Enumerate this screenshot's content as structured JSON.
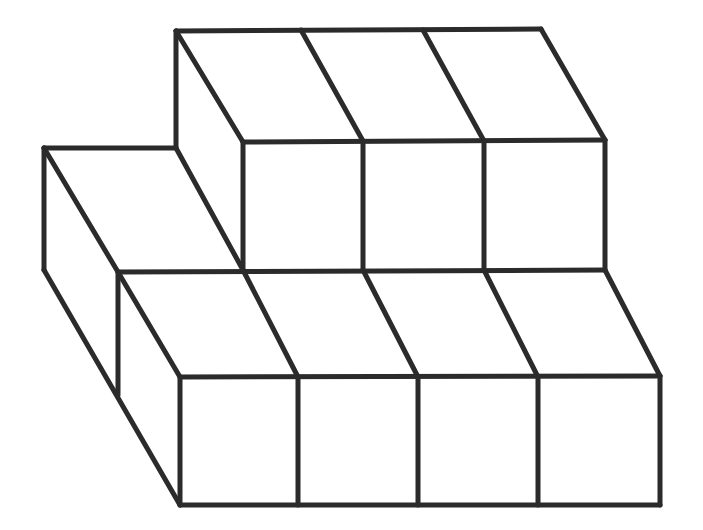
{
  "figure": {
    "stroke_color": "#2b2b2b",
    "stroke_width": 5,
    "background": "#ffffff",
    "lines": [
      [
        176,
        31,
        541,
        29
      ],
      [
        176,
        31,
        176,
        148
      ],
      [
        176,
        31,
        243,
        142
      ],
      [
        301,
        30,
        363,
        141
      ],
      [
        423,
        30,
        484,
        141
      ],
      [
        541,
        29,
        605,
        140
      ],
      [
        243,
        142,
        605,
        140
      ],
      [
        243,
        142,
        243,
        270
      ],
      [
        363,
        141,
        363,
        270
      ],
      [
        484,
        141,
        484,
        270
      ],
      [
        605,
        140,
        605,
        270
      ],
      [
        44,
        148,
        176,
        148
      ],
      [
        44,
        148,
        44,
        270
      ],
      [
        44,
        148,
        118,
        272
      ],
      [
        176,
        148,
        243,
        270
      ],
      [
        44,
        270,
        180,
        505
      ],
      [
        118,
        272,
        605,
        270
      ],
      [
        118,
        272,
        118,
        395
      ],
      [
        118,
        272,
        180,
        377
      ],
      [
        243,
        270,
        298,
        377
      ],
      [
        363,
        270,
        418,
        377
      ],
      [
        484,
        270,
        538,
        377
      ],
      [
        605,
        270,
        660,
        376
      ],
      [
        180,
        377,
        660,
        376
      ],
      [
        180,
        377,
        180,
        505
      ],
      [
        298,
        377,
        298,
        505
      ],
      [
        418,
        377,
        418,
        505
      ],
      [
        538,
        377,
        538,
        505
      ],
      [
        660,
        376,
        660,
        505
      ],
      [
        180,
        505,
        660,
        505
      ]
    ]
  }
}
